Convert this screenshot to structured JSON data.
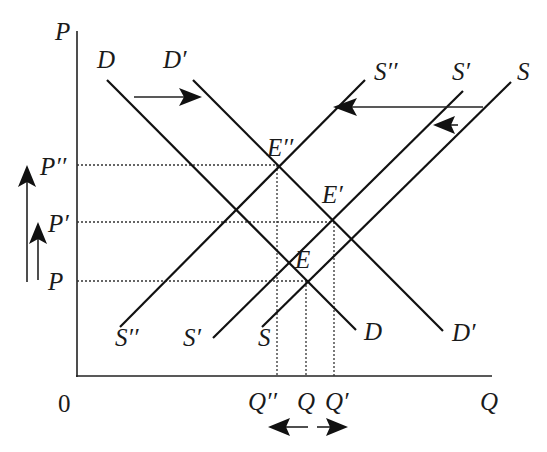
{
  "diagram": {
    "type": "supply-demand shift",
    "axes": {
      "y_label": "P",
      "x_label": "Q",
      "origin_label": "0"
    },
    "curves": [
      {
        "id": "D",
        "kind": "demand",
        "top_label": "D",
        "bottom_label": "D"
      },
      {
        "id": "D1",
        "kind": "demand",
        "top_label": "D′",
        "bottom_label": "D′"
      },
      {
        "id": "S",
        "kind": "supply",
        "top_label": "S",
        "bottom_label": "S"
      },
      {
        "id": "S1",
        "kind": "supply",
        "top_label": "S′",
        "bottom_label": "S′"
      },
      {
        "id": "S2",
        "kind": "supply",
        "top_label": "S′′",
        "bottom_label": "S′′"
      }
    ],
    "equilibria": [
      {
        "id": "E",
        "label": "E",
        "curves": [
          "D",
          "S"
        ]
      },
      {
        "id": "E1",
        "label": "E′",
        "curves": [
          "D1",
          "S1"
        ]
      },
      {
        "id": "E2",
        "label": "E′′",
        "curves": [
          "D1",
          "S2"
        ]
      }
    ],
    "price_levels": [
      {
        "id": "P",
        "label": "P"
      },
      {
        "id": "P1",
        "label": "P′"
      },
      {
        "id": "P2",
        "label": "P′′"
      }
    ],
    "quantity_levels": [
      {
        "id": "Q2",
        "label": "Q′′"
      },
      {
        "id": "Q",
        "label": "Q"
      },
      {
        "id": "Q1",
        "label": "Q′"
      }
    ],
    "shifts": [
      {
        "id": "demand-shift",
        "from": "D",
        "to": "D′",
        "direction": "right"
      },
      {
        "id": "supply-shift-small",
        "from": "S",
        "to": "S′",
        "direction": "left"
      },
      {
        "id": "supply-shift-large",
        "from": "S",
        "to": "S′′",
        "direction": "left"
      },
      {
        "id": "price-rise-small",
        "from": "P",
        "to": "P′",
        "direction": "up"
      },
      {
        "id": "price-rise-large",
        "from": "P",
        "to": "P′′",
        "direction": "up"
      },
      {
        "id": "quantity-ambiguous",
        "from": "Q",
        "to": [
          "Q′′",
          "Q′"
        ],
        "direction": "left-or-right"
      }
    ]
  }
}
